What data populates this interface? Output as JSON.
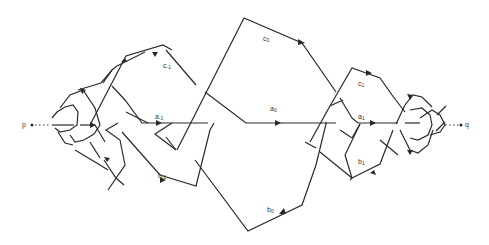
{
  "figure": {
    "endpoints": {
      "left": "p",
      "right": "q"
    },
    "labels": [
      {
        "id": "c_-1",
        "base": "c",
        "sub": "-1",
        "x": 163,
        "y": 63
      },
      {
        "id": "a_-1",
        "base": "a",
        "sub": "-1",
        "x": 155,
        "y": 113
      },
      {
        "id": "b_-1",
        "base": "b",
        "sub": "-1",
        "x": 158,
        "y": 172
      },
      {
        "id": "c_0",
        "base": "c",
        "sub": "0",
        "x": 262,
        "y": 35
      },
      {
        "id": "a_0",
        "base": "a",
        "sub": "0",
        "x": 270,
        "y": 105
      },
      {
        "id": "b_0",
        "base": "b",
        "sub": "0",
        "x": 267,
        "y": 206
      },
      {
        "id": "c_1",
        "base": "c",
        "sub": "1",
        "x": 358,
        "y": 80
      },
      {
        "id": "a_1",
        "base": "a",
        "sub": "1",
        "x": 358,
        "y": 113
      },
      {
        "id": "b_1",
        "base": "b",
        "sub": "1",
        "x": 358,
        "y": 158
      }
    ]
  },
  "text": {
    "p": "p",
    "q": "q",
    "c_m1": "c",
    "c_m1_sub": "-1",
    "a_m1": "a",
    "a_m1_sub": "-1",
    "b_m1": "b",
    "b_m1_sub": "-1",
    "c_0": "c",
    "c_0_sub": "0",
    "a_0": "a",
    "a_0_sub": "0",
    "b_0": "b",
    "b_0_sub": "0",
    "c_1": "c",
    "c_1_sub": "1",
    "a_1": "a",
    "a_1_sub": "1",
    "b_1": "b",
    "b_1_sub": "1"
  }
}
